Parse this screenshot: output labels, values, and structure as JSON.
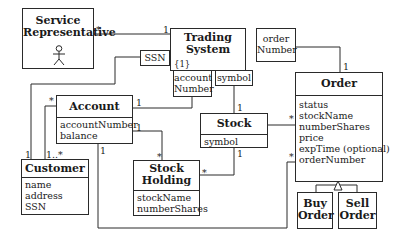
{
  "diagram": {
    "type": "UML class diagram",
    "classes": {
      "service_rep": {
        "name": "Service Representative",
        "line1": "Service",
        "line2": "Representative",
        "stereotype_icon": "actor-stick-figure"
      },
      "trading_system": {
        "line1": "Trading",
        "line2": "System",
        "constraint": "{1}"
      },
      "order": {
        "name": "Order",
        "attributes": [
          "status",
          "stockName",
          "numberShares",
          "price",
          "expTime (optional)",
          "orderNumber"
        ]
      },
      "account": {
        "name": "Account",
        "attributes": [
          "accountNumber",
          "balance"
        ]
      },
      "stock": {
        "name": "Stock",
        "attributes": [
          "symbol"
        ]
      },
      "customer": {
        "name": "Customer",
        "attributes": [
          "name",
          "address",
          "SSN"
        ]
      },
      "stock_holding": {
        "line1": "Stock",
        "line2": "Holding",
        "attributes": [
          "stockName",
          "numberShares"
        ]
      },
      "buy_order": {
        "line1": "Buy",
        "line2": "Order"
      },
      "sell_order": {
        "line1": "Sell",
        "line2": "Order"
      }
    },
    "qualifiers": {
      "ssn": "SSN",
      "account_number_1": "account",
      "account_number_2": "Number",
      "symbol": "symbol",
      "order_number_1": "order",
      "order_number_2": "Number"
    },
    "multiplicities": {
      "servicerep_ts_rep": "*",
      "servicerep_ts_ts": "1",
      "ts_order_order": "1",
      "ts_account_account": "1",
      "ts_stock_stock": "1",
      "ssn_customer": "1",
      "customer_account_account": "*",
      "customer_account_customer": "1..*",
      "account_holding_account": "1",
      "account_holding_holding": "*",
      "stock_holding_stock": "1",
      "stock_holding_holding": "*",
      "stock_order_order": "*",
      "account_order_account": "1",
      "account_order_order": "*"
    }
  }
}
